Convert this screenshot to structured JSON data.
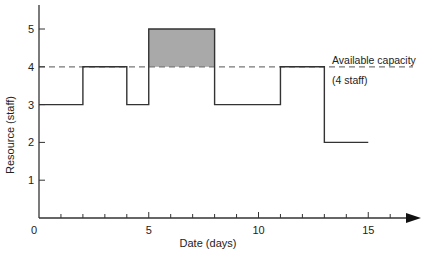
{
  "chart_data": {
    "type": "line",
    "subtype": "step",
    "title": "",
    "xlabel": "Date (days)",
    "ylabel": "Resource (staff)",
    "xlim": [
      0,
      17
    ],
    "ylim": [
      0,
      5.6
    ],
    "x_ticks": [
      0,
      1,
      2,
      3,
      4,
      5,
      6,
      7,
      8,
      9,
      10,
      11,
      12,
      13,
      14,
      15,
      16
    ],
    "x_tick_labels": {
      "0": "0",
      "5": "5",
      "10": "10",
      "15": "15"
    },
    "y_ticks": [
      1,
      2,
      3,
      4,
      5
    ],
    "y_tick_labels": [
      "1",
      "2",
      "3",
      "4",
      "5"
    ],
    "grid": false,
    "series": [
      {
        "name": "Resource demand",
        "steps": [
          {
            "start": 0,
            "end": 2,
            "value": 3
          },
          {
            "start": 2,
            "end": 4,
            "value": 4
          },
          {
            "start": 4,
            "end": 5,
            "value": 3
          },
          {
            "start": 5,
            "end": 8,
            "value": 5
          },
          {
            "start": 8,
            "end": 11,
            "value": 3
          },
          {
            "start": 11,
            "end": 13,
            "value": 4
          },
          {
            "start": 13,
            "end": 15,
            "value": 2
          }
        ]
      }
    ],
    "reference_lines": [
      {
        "type": "horizontal",
        "y": 4,
        "style": "dashed",
        "label_line1": "Available capacity",
        "label_line2": "(4 staff)"
      }
    ],
    "shaded_regions": [
      {
        "x_start": 5,
        "x_end": 8,
        "y_start": 4,
        "y_end": 5,
        "color": "#a9a9a9",
        "meaning": "over capacity"
      }
    ]
  },
  "colors": {
    "line": "#333333",
    "dashed": "#777777",
    "shade": "#a9a9a9",
    "text": "#222222"
  }
}
